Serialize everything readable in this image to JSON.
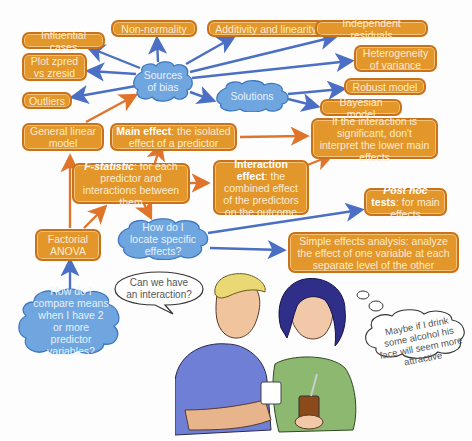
{
  "colors": {
    "box_fill": "#e3962a",
    "box_border": "#c9721a",
    "cloud_fill": "#6fa6e0",
    "cloud_border": "#3f78c0",
    "arrow_blue": "#4a6fc4",
    "arrow_orange": "#e0742a"
  },
  "boxes": {
    "influential_cases": "Influential cases",
    "non_normality": "Non-normality",
    "additivity": "Additivity and linearity",
    "independent_residuals": "Independent residuals",
    "plot_zpred": "Plot zpred vs zresid",
    "heterogeneity": "Heterogeneity of variance",
    "outliers": "Outliers",
    "robust_model": "Robust model",
    "bayesian_model": "Bayesian model",
    "general_linear_model": "General linear model",
    "main_effect_bold": "Main effect",
    "main_effect_rest": ": the isolated effect of a predictor",
    "if_interaction": "If the interaction is significant, don't interpret the lower main effects",
    "f_statistic_bold": "F-statistic",
    "f_statistic_rest": ": for each predictor and interactions between them",
    "interaction_effect_bold": "Interaction effect",
    "interaction_effect_rest": ": the combined effect of the predictors on the outcome",
    "post_hoc_italic": "Post hoc",
    "post_hoc_bold": " tests",
    "post_hoc_rest": ": for main effects",
    "factorial_anova": "Factorial ANOVA",
    "simple_effects": "Simple effects analysis: analyze the effect of one variable at each separate level of the other"
  },
  "clouds": {
    "sources_of_bias": "Sources of bias",
    "solutions": "Solutions",
    "locate_effects": "How do I locate specific effects?",
    "compare_means": "How do I compare means when I have 2 or more predictor variables?"
  },
  "speech": {
    "man": "Can we have an interaction?",
    "woman_thought": "Maybe if I drink some alcohol his face will seem more attractive"
  }
}
